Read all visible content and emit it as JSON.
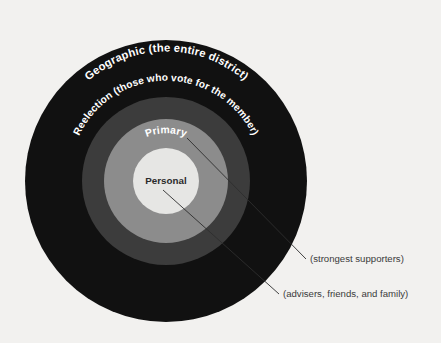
{
  "diagram": {
    "background_color": "#f2f1ef",
    "rings": [
      {
        "key": "geographic",
        "label": "Geographic (the entire district)",
        "color": "#111111",
        "text_color": "#ffffff",
        "outer_radius": 141,
        "inner_radius": 84
      },
      {
        "key": "reelection",
        "label": "Reelection (those who vote for the member)",
        "color": "#3c3c3c",
        "text_color": "#ffffff",
        "outer_radius": 84,
        "inner_radius": 62
      },
      {
        "key": "primary",
        "label": "Primary",
        "color": "#8c8c8c",
        "text_color": "#ffffff",
        "outer_radius": 62,
        "inner_radius": 33
      },
      {
        "key": "personal",
        "label": "Personal",
        "color": "#e6e6e4",
        "text_color": "#2b2b2b",
        "outer_radius": 33,
        "inner_radius": 0
      }
    ],
    "center": {
      "cx": 166,
      "cy": 181
    },
    "callouts": [
      {
        "key": "strongest-supporters",
        "text": "(strongest supporters)",
        "refers_to": "primary",
        "x": 310,
        "y": 262
      },
      {
        "key": "advisers-friends-family",
        "text": "(advisers, friends, and family)",
        "x": 283,
        "y": 297
      }
    ]
  }
}
